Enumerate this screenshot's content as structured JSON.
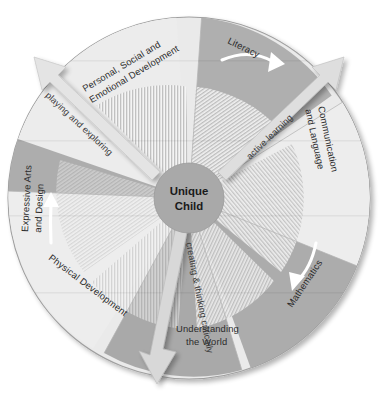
{
  "diagram": {
    "center": {
      "line1": "Unique",
      "line2": "Child",
      "color": "#a8a8a8"
    },
    "areas": [
      {
        "id": "personal-social-emotional",
        "line1": "Personal, Social and",
        "line2": "Emotional Development",
        "color": "#e9e9e9",
        "has_arrow": false
      },
      {
        "id": "literacy",
        "line1": "Literacy",
        "line2": "",
        "color": "#a9a9a9",
        "has_arrow": true
      },
      {
        "id": "communication-and-language",
        "line1": "Communication",
        "line2": "and Language",
        "color": "#ededed",
        "has_arrow": false
      },
      {
        "id": "mathematics",
        "line1": "Mathematics",
        "line2": "",
        "color": "#a6a6a6",
        "has_arrow": true
      },
      {
        "id": "understanding-the-world",
        "line1": "Understanding",
        "line2": "the World",
        "color": "#a4a4a4",
        "has_arrow": false
      },
      {
        "id": "physical-development",
        "line1": "Physical Development",
        "line2": "",
        "color": "#ececec",
        "has_arrow": false
      },
      {
        "id": "expressive-arts-and-design",
        "line1": "Expressive Arts",
        "line2": "and Design",
        "color": "#a7a7a7",
        "has_arrow": true
      }
    ],
    "bands": [
      {
        "id": "playing-and-exploring",
        "label": "playing and exploring",
        "color": "#e2e2e2"
      },
      {
        "id": "active-learning",
        "label": "active learning",
        "color": "#dcdcdc"
      },
      {
        "id": "creating-and-thinking-critically",
        "label": "creating & thinking critically",
        "color": "#d6d6d6"
      }
    ],
    "colors": {
      "background": "#ffffff",
      "hatch_stripe": "#bdbdbd",
      "hatch_base": "#f2f2f2",
      "outline": "#9a9a9a",
      "arrow_white": "#ffffff",
      "text": "#2b2b2b"
    }
  }
}
